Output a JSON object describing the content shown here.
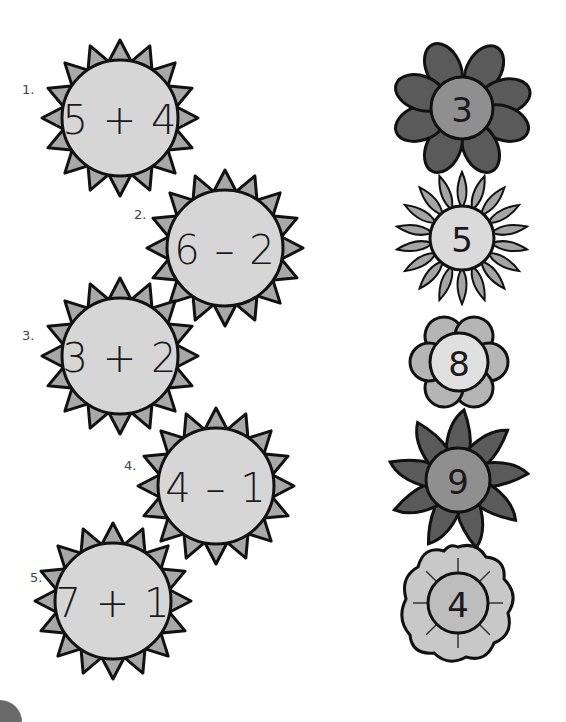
{
  "problems": [
    {
      "number": "1.",
      "expression": "5 + 4",
      "cx": 120,
      "cy": 118,
      "label_x": 22,
      "label_y": 82
    },
    {
      "number": "2.",
      "expression": "6 – 2",
      "cx": 225,
      "cy": 248,
      "label_x": 134,
      "label_y": 207
    },
    {
      "number": "3.",
      "expression": "3 + 2",
      "cx": 120,
      "cy": 356,
      "label_x": 22,
      "label_y": 328
    },
    {
      "number": "4.",
      "expression": "4 – 1",
      "cx": 216,
      "cy": 486,
      "label_x": 124,
      "label_y": 458
    },
    {
      "number": "5.",
      "expression": "7 + 1",
      "cx": 113,
      "cy": 601,
      "label_x": 30,
      "label_y": 570
    }
  ],
  "answers": [
    {
      "value": "3",
      "style": "rounded-petals-dark",
      "cx": 462,
      "cy": 108
    },
    {
      "value": "5",
      "style": "pointed-petals-light",
      "cx": 462,
      "cy": 238
    },
    {
      "value": "8",
      "style": "scalloped-light",
      "cx": 459,
      "cy": 362
    },
    {
      "value": "9",
      "style": "long-petals-dark",
      "cx": 458,
      "cy": 480
    },
    {
      "value": "4",
      "style": "wavy-light",
      "cx": 458,
      "cy": 603
    }
  ],
  "colors": {
    "sun_face": "#d6d6d6",
    "sun_ray": "#a8a8a8",
    "outline": "#111111",
    "dark_petal": "#5a5a5a",
    "mid_center": "#8f8f8f",
    "light_petal": "#b5b5b5",
    "light_center": "#dadada"
  }
}
